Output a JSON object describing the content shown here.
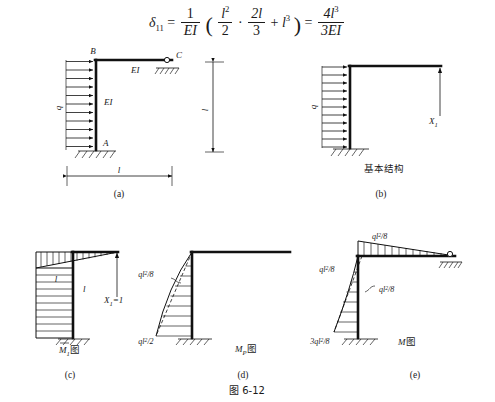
{
  "figure": {
    "caption": "图 6-12",
    "number": "6-12"
  },
  "formula": {
    "lhs_symbol": "δ",
    "lhs_sub": "11",
    "equals": "=",
    "one": "1",
    "EI": "EI",
    "l_sq": "l",
    "l_sq_exp": "2",
    "two": "2",
    "two_l": "2l",
    "three": "3",
    "dot": "·",
    "plus": "+",
    "l_cubed": "l",
    "l_cubed_exp": "3",
    "rhs_num": "4l",
    "rhs_num_exp": "3",
    "rhs_den": "3EI",
    "open_paren": "(",
    "close_paren": ")"
  },
  "panels": [
    {
      "id": "a",
      "sublabel": "(a)",
      "labels": {
        "joint_top": "B",
        "joint_base": "A",
        "joint_right": "C",
        "load": "q",
        "stiffness_column": "EI",
        "stiffness_beam": "EI",
        "dim_vertical": "l",
        "dim_horizontal": "l"
      },
      "support_base": "fixed-support",
      "support_right": "pin-support",
      "load_arrow_count": 11,
      "load_direction": "right"
    },
    {
      "id": "b",
      "sublabel": "(b)",
      "labels": {
        "load": "q",
        "redundant": "X",
        "redundant_sub": "1",
        "title_cn": "基本结构"
      },
      "support_base": "fixed-support",
      "load_arrow_count": 11,
      "load_direction": "right",
      "redundant_direction": "up"
    },
    {
      "id": "c",
      "sublabel": "(c)",
      "labels": {
        "unit_force": "X",
        "unit_force_sub": "1",
        "unit_force_value": "=1",
        "column_ordinate": "l",
        "beam_ordinate": "l",
        "diagram_title": "M",
        "diagram_title_sub": "1",
        "diagram_title_cn": "图",
        "overbar": true
      },
      "diagram_type": "unit-moment-diagram"
    },
    {
      "id": "d",
      "sublabel": "(d)",
      "labels": {
        "top_value": "ql",
        "top_value_exp": "2",
        "top_value_den": "/8",
        "base_value": "ql",
        "base_value_exp": "2",
        "base_value_den": "/2",
        "diagram_title": "M",
        "diagram_title_sub": "P",
        "diagram_title_cn": "图"
      },
      "diagram_type": "load-moment-diagram",
      "curve": "parabolic"
    },
    {
      "id": "e",
      "sublabel": "(e)",
      "labels": {
        "beam_top": "ql",
        "beam_top_exp": "2",
        "beam_top_den": "/8",
        "corner_left": "ql",
        "corner_left_exp": "2",
        "corner_left_den": "/8",
        "mid_right": "ql",
        "mid_right_exp": "2",
        "mid_right_den": "/8",
        "base_value": "3ql",
        "base_value_exp": "2",
        "base_value_den": "/8",
        "diagram_title": "M",
        "diagram_title_cn": "图"
      },
      "diagram_type": "final-moment-diagram",
      "support_right": "pin-support",
      "curve": "parabolic"
    }
  ],
  "colors": {
    "ink": "#1a1a1a",
    "line": "#111111",
    "background": "#ffffff"
  }
}
